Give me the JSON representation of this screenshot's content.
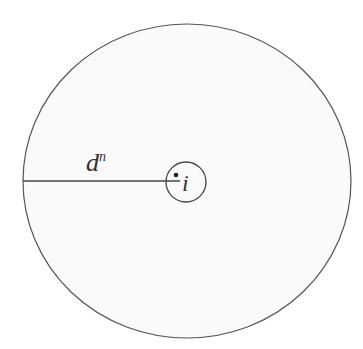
{
  "diagram": {
    "outer_circle": {
      "fill": "#fafafa",
      "stroke": "#555555"
    },
    "radius_label": {
      "base": "d",
      "superscript": "n"
    },
    "center_label": "i"
  }
}
